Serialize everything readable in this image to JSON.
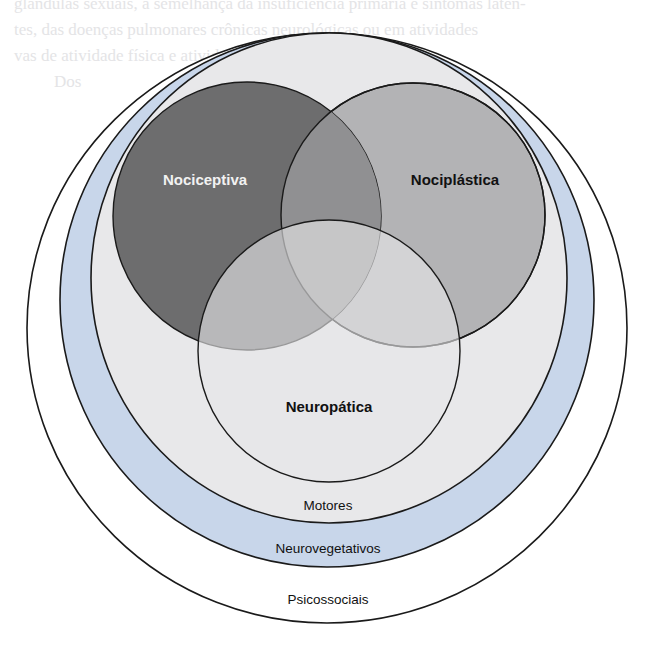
{
  "background_text": {
    "lines": [
      "glândulas sexuais, a semelhança da insuficiência primária e sintomas laten-",
      "tes, das doenças pulmonares crônicas neurológicas ou em atividades",
      "vas de atividade física e atividade de acompanhamentos.",
      "Dos"
    ]
  },
  "diagram": {
    "title": "",
    "colors": {
      "nociceptiva": "#6d6d6e",
      "nociplastica": "#b3b3b5",
      "neuropatica": "#dadadc",
      "overlap_noci_nocipl": "#909092",
      "motores_ring": "#e8e8ea",
      "neurovegetativos_ring": "#c8d6ea",
      "psicossociais_ring": "#ffffff",
      "stroke": "#1a1a1a"
    },
    "inner_circles": [
      {
        "id": "nociceptiva",
        "label": "Nociceptiva",
        "label_color": "#f2f2f2"
      },
      {
        "id": "nociplastica",
        "label": "Nociplástica",
        "label_color": "#111111"
      },
      {
        "id": "neuropatica",
        "label": "Neuropática",
        "label_color": "#111111"
      }
    ],
    "rings": [
      {
        "id": "motores",
        "label": "Motores"
      },
      {
        "id": "neurovegetativos",
        "label": "Neurovegetativos"
      },
      {
        "id": "psicossociais",
        "label": "Psicossociais"
      }
    ]
  }
}
